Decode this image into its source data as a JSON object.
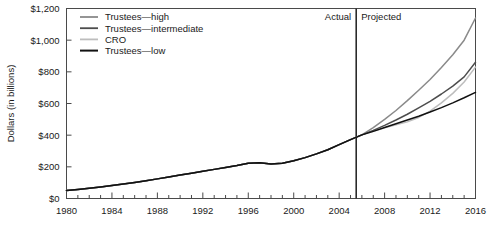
{
  "chart_data": {
    "type": "line",
    "title": "",
    "xlabel": "",
    "ylabel": "Dollars (in billions)",
    "xlim": [
      1980,
      2016
    ],
    "ylim": [
      0,
      1200
    ],
    "grid": false,
    "legend_position": "top-left",
    "x_ticks_major": [
      1980,
      1984,
      1988,
      1992,
      1996,
      2000,
      2004,
      2008,
      2012,
      2016
    ],
    "x_ticks_minor_step": 1,
    "y_ticks": [
      0,
      200,
      400,
      600,
      800,
      1000,
      1200
    ],
    "y_tick_labels": [
      "$0",
      "$200",
      "$400",
      "$600",
      "$800",
      "$1,000",
      "$1,200"
    ],
    "annotations": [
      {
        "name": "actual-label",
        "text": "Actual",
        "x": 2005,
        "align": "right"
      },
      {
        "name": "projected-label",
        "text": "Projected",
        "x": 2006,
        "align": "left"
      },
      {
        "name": "divider",
        "text": "",
        "x": 2005.5
      }
    ],
    "divider_year": 2005.5,
    "legend": [
      {
        "name": "Trustees—high",
        "color": "#8a8a8a"
      },
      {
        "name": "Trustees—intermediate",
        "color": "#4d4d4d"
      },
      {
        "name": "CRO",
        "color": "#bdbdbd"
      },
      {
        "name": "Trustees—low",
        "color": "#111111"
      }
    ],
    "series": [
      {
        "name": "Trustees—high",
        "color": "#8a8a8a",
        "x": [
          1980,
          1981,
          1982,
          1983,
          1984,
          1985,
          1986,
          1987,
          1988,
          1989,
          1990,
          1991,
          1992,
          1993,
          1994,
          1995,
          1996,
          1997,
          1998,
          1999,
          2000,
          2001,
          2002,
          2003,
          2004,
          2005,
          2006,
          2007,
          2008,
          2009,
          2010,
          2011,
          2012,
          2013,
          2014,
          2015,
          2016
        ],
        "values": [
          50,
          57,
          65,
          73,
          82,
          91,
          101,
          112,
          124,
          136,
          148,
          160,
          172,
          184,
          196,
          208,
          222,
          226,
          218,
          222,
          238,
          258,
          282,
          308,
          340,
          372,
          402,
          448,
          500,
          556,
          618,
          684,
          752,
          828,
          908,
          1000,
          1140
        ]
      },
      {
        "name": "Trustees—intermediate",
        "color": "#4d4d4d",
        "x": [
          1980,
          1981,
          1982,
          1983,
          1984,
          1985,
          1986,
          1987,
          1988,
          1989,
          1990,
          1991,
          1992,
          1993,
          1994,
          1995,
          1996,
          1997,
          1998,
          1999,
          2000,
          2001,
          2002,
          2003,
          2004,
          2005,
          2006,
          2007,
          2008,
          2009,
          2010,
          2011,
          2012,
          2013,
          2014,
          2015,
          2016
        ],
        "values": [
          50,
          57,
          65,
          73,
          82,
          91,
          101,
          112,
          124,
          136,
          148,
          160,
          172,
          184,
          196,
          208,
          222,
          226,
          218,
          222,
          238,
          258,
          282,
          308,
          340,
          372,
          402,
          430,
          462,
          496,
          532,
          572,
          614,
          660,
          710,
          768,
          860
        ]
      },
      {
        "name": "CRO",
        "color": "#bdbdbd",
        "x": [
          1980,
          1981,
          1982,
          1983,
          1984,
          1985,
          1986,
          1987,
          1988,
          1989,
          1990,
          1991,
          1992,
          1993,
          1994,
          1995,
          1996,
          1997,
          1998,
          1999,
          2000,
          2001,
          2002,
          2003,
          2004,
          2005,
          2006,
          2007,
          2008,
          2009,
          2010,
          2011,
          2012,
          2013,
          2014,
          2015,
          2016
        ],
        "values": [
          50,
          57,
          65,
          73,
          82,
          91,
          101,
          112,
          124,
          136,
          148,
          160,
          172,
          184,
          196,
          208,
          222,
          226,
          218,
          222,
          238,
          258,
          282,
          308,
          340,
          372,
          402,
          424,
          446,
          466,
          484,
          512,
          552,
          604,
          664,
          736,
          830
        ]
      },
      {
        "name": "Trustees—low",
        "color": "#111111",
        "x": [
          1980,
          1981,
          1982,
          1983,
          1984,
          1985,
          1986,
          1987,
          1988,
          1989,
          1990,
          1991,
          1992,
          1993,
          1994,
          1995,
          1996,
          1997,
          1998,
          1999,
          2000,
          2001,
          2002,
          2003,
          2004,
          2005,
          2006,
          2007,
          2008,
          2009,
          2010,
          2011,
          2012,
          2013,
          2014,
          2015,
          2016
        ],
        "values": [
          50,
          57,
          65,
          73,
          82,
          91,
          101,
          112,
          124,
          136,
          148,
          160,
          172,
          184,
          196,
          208,
          222,
          226,
          218,
          222,
          238,
          258,
          282,
          308,
          340,
          372,
          402,
          424,
          448,
          472,
          496,
          520,
          546,
          574,
          604,
          636,
          670
        ]
      }
    ]
  }
}
